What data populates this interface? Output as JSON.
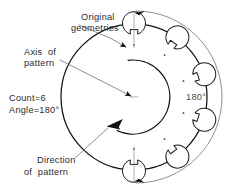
{
  "drawing": {
    "title": "Circular pattern of original geometries about a pattern axis",
    "background_color": "#ffffff",
    "line_color": "#1a1a1a",
    "leader_color": "#5d5d5d"
  },
  "annotations": {
    "original_geometries": {
      "line1": "Original",
      "line2": "geometries"
    },
    "axis_of_pattern": {
      "line1": "Axis  of",
      "line2": "pattern"
    },
    "parameters": {
      "count_label": "Count=6",
      "angle_label": "Angle=180°"
    },
    "direction_of_pattern": {
      "line1": "Direction",
      "line2": "of  pattern"
    },
    "angle_dimension": {
      "value": "180°"
    }
  },
  "geometry": {
    "part": {
      "outer_circle": {
        "cx": 134,
        "cy": 97,
        "r": 73
      },
      "inner_cutout_radius": 37,
      "inner_cutout_start_angle_deg": 100,
      "inner_cutout_end_angle_deg": 440
    },
    "pattern": {
      "count": 6,
      "total_angle_deg": 180,
      "increment_angle_deg": 36,
      "feature_orbit_radius": 52,
      "feature_radius": 11.5,
      "tab_size": 5.0,
      "features": [
        {
          "index": 0,
          "is_original": true,
          "orbit_angle_deg": -90,
          "tab_rotation_deg": 0
        },
        {
          "index": 1,
          "is_original": false,
          "orbit_angle_deg": -54,
          "tab_rotation_deg": 36
        },
        {
          "index": 2,
          "is_original": false,
          "orbit_angle_deg": -18,
          "tab_rotation_deg": 72
        },
        {
          "index": 3,
          "is_original": false,
          "orbit_angle_deg": 18,
          "tab_rotation_deg": 108
        },
        {
          "index": 4,
          "is_original": false,
          "orbit_angle_deg": 54,
          "tab_rotation_deg": 144
        },
        {
          "index": 5,
          "is_original": false,
          "orbit_angle_deg": 90,
          "tab_rotation_deg": 180
        }
      ]
    },
    "dimension_arc": {
      "cx": 134,
      "cy": 97,
      "r": 86
    },
    "axis_center": {
      "x": 134,
      "y": 97
    }
  }
}
